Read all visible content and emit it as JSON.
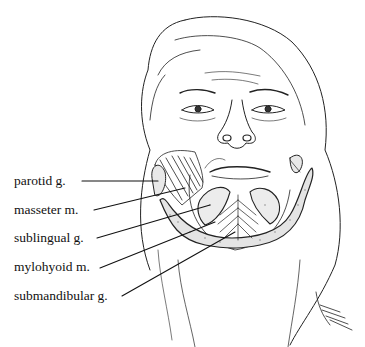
{
  "figure": {
    "labels": [
      {
        "text": "parotid g.",
        "x": 14,
        "y": 174,
        "line": [
          82,
          181,
          158,
          181
        ]
      },
      {
        "text": "masseter m.",
        "x": 14,
        "y": 203,
        "line": [
          94,
          210,
          185,
          188
        ]
      },
      {
        "text": "sublingual g.",
        "x": 14,
        "y": 231,
        "line": [
          97,
          238,
          210,
          205
        ]
      },
      {
        "text": "mylohyoid m.",
        "x": 14,
        "y": 260,
        "line": [
          100,
          268,
          215,
          222
        ]
      },
      {
        "text": "submandibular g.",
        "x": 14,
        "y": 289,
        "line": [
          122,
          296,
          235,
          232
        ]
      }
    ],
    "signature": "signature"
  }
}
